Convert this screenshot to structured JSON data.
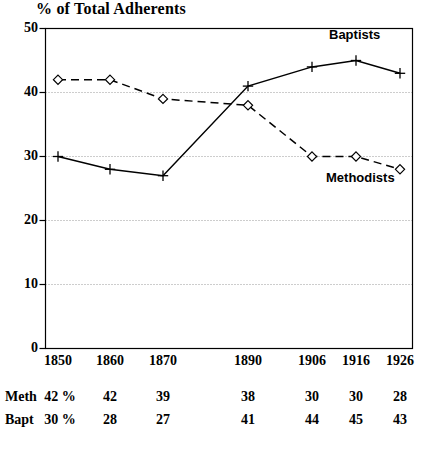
{
  "chart_data": {
    "type": "line",
    "title": "% of Total Adherents",
    "xlabel": "",
    "ylabel": "",
    "ylim": [
      0,
      50
    ],
    "yticks": [
      0,
      10,
      20,
      30,
      40,
      50
    ],
    "grid": true,
    "grid_style": "dotted-horizontal",
    "legend_position": "inline-annotation",
    "categories": [
      "1850",
      "1860",
      "1870",
      "1890",
      "1906",
      "1916",
      "1926"
    ],
    "series": [
      {
        "name": "Methodists",
        "values": [
          42,
          42,
          39,
          38,
          30,
          30,
          28
        ],
        "line_style": "dashed",
        "marker": "diamond",
        "color": "#000000"
      },
      {
        "name": "Baptists",
        "values": [
          30,
          28,
          27,
          41,
          44,
          45,
          43
        ],
        "line_style": "solid",
        "marker": "plus",
        "color": "#000000"
      }
    ],
    "annotations": [
      {
        "text": "Baptists",
        "near_series": "Baptists"
      },
      {
        "text": "Methodists",
        "near_series": "Methodists"
      }
    ]
  },
  "axis": {
    "y_tick_labels": [
      "50",
      "40",
      "30",
      "20",
      "10",
      "0"
    ],
    "x_tick_labels": [
      "1850",
      "1860",
      "1870",
      "1890",
      "1906",
      "1916",
      "1926"
    ]
  },
  "data_table": {
    "rows": [
      {
        "label": "Meth",
        "cells": [
          "42 %",
          "42",
          "39",
          "38",
          "30",
          "30",
          "28"
        ]
      },
      {
        "label": "Bapt",
        "cells": [
          "30 %",
          "28",
          "27",
          "41",
          "44",
          "45",
          "43"
        ]
      }
    ]
  },
  "labels": {
    "baptists": "Baptists",
    "methodists": "Methodists"
  }
}
